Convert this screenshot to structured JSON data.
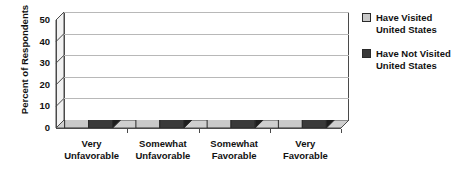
{
  "chart_data": {
    "type": "bar",
    "title": "",
    "subtitle": "",
    "xlabel": "",
    "ylabel": "Percent of Respondents",
    "ylim": [
      0,
      50
    ],
    "yticks": [
      0,
      10,
      20,
      30,
      40,
      50
    ],
    "grid": true,
    "legend_position": "right",
    "style": "3d-grouped-column",
    "categories": [
      "Very Unfavorable",
      "Somewhat Unfavorable",
      "Somewhat Favorable",
      "Very Favorable"
    ],
    "category_lines": [
      [
        "Very",
        "Unfavorable"
      ],
      [
        "Somewhat",
        "Unfavorable"
      ],
      [
        "Somewhat",
        "Favorable"
      ],
      [
        "Very",
        "Favorable"
      ]
    ],
    "series": [
      {
        "name": "Have Visited United States",
        "name_lines": [
          "Have Visited",
          "United States"
        ],
        "color": "#c9c9c9",
        "values": [
          9,
          16,
          46,
          24
        ]
      },
      {
        "name": "Have Not Visited United States",
        "name_lines": [
          "Have Not Visited",
          "United States"
        ],
        "color": "#3a3a3a",
        "values": [
          15,
          17,
          40,
          20
        ]
      }
    ]
  },
  "axis": {
    "tick_labels": [
      "0",
      "10",
      "20",
      "30",
      "40",
      "50"
    ]
  },
  "legend": {
    "entries": [
      {
        "line1": "Have Visited",
        "line2": "United States",
        "swatch": "#c9c9c9"
      },
      {
        "line1": "Have Not Visited",
        "line2": "United States",
        "swatch": "#3a3a3a"
      }
    ]
  },
  "colors": {
    "series_light": "#c9c9c9",
    "series_light_top": "#e2e2e2",
    "series_light_side": "#9e9e9e",
    "series_dark": "#3a3a3a",
    "series_dark_top": "#606060",
    "series_dark_side": "#1e1e1e",
    "gridline": "#b8b8b8",
    "axis": "#4a4a4a",
    "floor": "#cfcfcf",
    "sidewall": "#f2f2f2",
    "background": "#ffffff"
  }
}
